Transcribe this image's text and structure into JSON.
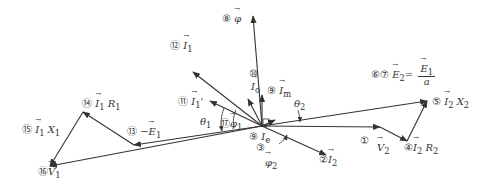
{
  "diagram": {
    "colors": {
      "line": "#333333",
      "background": "#ffffff"
    },
    "origin": [
      262,
      126
    ],
    "vectors": [
      {
        "id": "phi",
        "from": [
          262,
          126
        ],
        "to": [
          253,
          16
        ]
      },
      {
        "id": "V2",
        "from": [
          262,
          126
        ],
        "to": [
          380,
          127
        ]
      },
      {
        "id": "I2R2",
        "from": [
          380,
          127
        ],
        "to": [
          407,
          141
        ]
      },
      {
        "id": "I2X2",
        "from": [
          407,
          141
        ],
        "to": [
          427,
          101
        ]
      },
      {
        "id": "E2",
        "from": [
          262,
          126
        ],
        "to": [
          427,
          101
        ]
      },
      {
        "id": "I2",
        "from": [
          262,
          126
        ],
        "to": [
          326,
          155
        ]
      },
      {
        "id": "negE1",
        "from": [
          262,
          126
        ],
        "to": [
          134,
          145
        ]
      },
      {
        "id": "I1R1",
        "from": [
          134,
          145
        ],
        "to": [
          83,
          112
        ]
      },
      {
        "id": "I1X1",
        "from": [
          83,
          112
        ],
        "to": [
          50,
          166
        ]
      },
      {
        "id": "V1",
        "from": [
          262,
          126
        ],
        "to": [
          50,
          166
        ]
      },
      {
        "id": "I1",
        "from": [
          262,
          126
        ],
        "to": [
          193,
          72
        ]
      },
      {
        "id": "I1prime",
        "from": [
          262,
          126
        ],
        "to": [
          210,
          101
        ]
      },
      {
        "id": "I0",
        "from": [
          262,
          126
        ],
        "to": [
          248,
          99
        ]
      },
      {
        "id": "Im",
        "from": [
          262,
          126
        ],
        "to": [
          262,
          95
        ]
      },
      {
        "id": "Ie",
        "from": [
          262,
          126
        ],
        "to": [
          275,
          120
        ]
      }
    ],
    "labels": {
      "l8": {
        "num": "⑧",
        "sym": "φ"
      },
      "l12": {
        "num": "⑫",
        "sym": "I",
        "sub": "1"
      },
      "l10": {
        "num": "⑩"
      },
      "l10sym": {
        "sym": "I",
        "sub": "o"
      },
      "l9m": {
        "num": "⑨",
        "sym": "I",
        "sub": "m"
      },
      "l67": {
        "num": "⑥⑦",
        "expr_left": "E",
        "sub_left": "2",
        "eq": "=",
        "numer": "E",
        "numer_sub": "1",
        "denom": "a"
      },
      "l5": {
        "num": "⑤",
        "sym": "I",
        "sub": "2",
        "sym2": "X",
        "sub2": "2"
      },
      "theta2": {
        "sym": "θ",
        "sub": "2"
      },
      "l11": {
        "num": "⑪",
        "sym": "I",
        "sub": "1",
        "prime": "'"
      },
      "theta1": {
        "sym": "θ",
        "sub": "1"
      },
      "l17": {
        "num": "⑰",
        "sym": "φ",
        "sub": "1"
      },
      "l14": {
        "num": "⑭",
        "sym": "I",
        "sub": "1",
        "sym2": "R",
        "sub2": "1"
      },
      "l15": {
        "num": "⑮",
        "sym": "I",
        "sub": "1",
        "sym2": "X",
        "sub2": "1"
      },
      "l13": {
        "num": "⑬",
        "prefix": "−",
        "sym": "E",
        "sub": "1"
      },
      "l16": {
        "num": "⑯",
        "sym": "V",
        "sub": "1"
      },
      "l9e": {
        "num": "⑨",
        "sym": "I",
        "sub": "e"
      },
      "l3": {
        "num": "③"
      },
      "phi2": {
        "sym": "φ",
        "sub": "2"
      },
      "l2": {
        "num": "②",
        "sym": "I",
        "sub": "2"
      },
      "l1": {
        "num": "①"
      },
      "v2": {
        "sym": "V",
        "sub": "2"
      },
      "l4": {
        "num": "④",
        "sym": "I",
        "sub": "2",
        "sym2": "R",
        "sub2": "2"
      }
    }
  }
}
